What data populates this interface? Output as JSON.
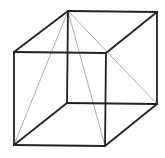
{
  "diagram": {
    "type": "wireframe-cube",
    "colors": {
      "background": "#ffffff",
      "edge": "#222222",
      "diagonal": "#888888"
    },
    "vertices": {
      "front_top_left": [
        14,
        52
      ],
      "front_top_right": [
        106,
        53
      ],
      "front_bottom_left": [
        14,
        145
      ],
      "front_bottom_right": [
        105,
        146
      ],
      "back_top_left": [
        68,
        11
      ],
      "back_top_right": [
        157,
        12
      ],
      "back_bottom_left": [
        67,
        103
      ],
      "back_bottom_right": [
        157,
        104
      ]
    },
    "edges": [
      [
        "front_top_left",
        "front_top_right"
      ],
      [
        "front_top_right",
        "front_bottom_right"
      ],
      [
        "front_bottom_right",
        "front_bottom_left"
      ],
      [
        "front_bottom_left",
        "front_top_left"
      ],
      [
        "back_top_left",
        "back_top_right"
      ],
      [
        "back_top_right",
        "back_bottom_right"
      ],
      [
        "back_bottom_right",
        "back_bottom_left"
      ],
      [
        "back_bottom_left",
        "back_top_left"
      ],
      [
        "front_top_left",
        "back_top_left"
      ],
      [
        "front_top_right",
        "back_top_right"
      ],
      [
        "front_bottom_left",
        "back_bottom_left"
      ],
      [
        "front_bottom_right",
        "back_bottom_right"
      ]
    ],
    "diagonals": [
      [
        "back_top_left",
        "front_bottom_left"
      ],
      [
        "back_top_left",
        "front_bottom_right"
      ],
      [
        "back_top_left",
        "back_bottom_right"
      ]
    ]
  }
}
